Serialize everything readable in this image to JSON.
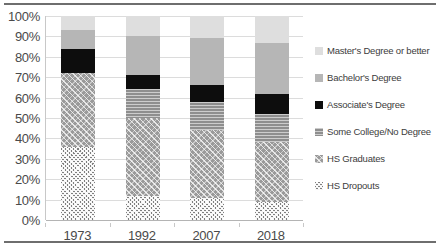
{
  "chart_data": {
    "type": "bar",
    "subtype": "stacked-bar-100-percent",
    "title": "",
    "xlabel": "",
    "ylabel": "",
    "categories": [
      "1973",
      "1992",
      "2007",
      "2018"
    ],
    "ylim": [
      0,
      100
    ],
    "y_ticks": [
      "0%",
      "10%",
      "20%",
      "30%",
      "40%",
      "50%",
      "60%",
      "70%",
      "80%",
      "90%",
      "100%"
    ],
    "y_tick_values": [
      0,
      10,
      20,
      30,
      40,
      50,
      60,
      70,
      80,
      90,
      100
    ],
    "grid": true,
    "legend_position": "right",
    "series": [
      {
        "name": "HS Dropouts",
        "swatch": "dots-sparse",
        "color": "#7f7f7f",
        "values": [
          36,
          12,
          11,
          9
        ]
      },
      {
        "name": "HS Graduates",
        "swatch": "crosshatch-dense",
        "color": "#9a9a9a",
        "values": [
          36,
          38,
          33,
          29
        ]
      },
      {
        "name": "Some College/No Degree",
        "swatch": "horizontal-lines",
        "color": "#8e8e8e",
        "values": [
          0,
          14,
          14,
          14
        ]
      },
      {
        "name": "Associate's Degree",
        "swatch": "solid-black",
        "color": "#0d0d0d",
        "values": [
          12,
          7,
          8,
          10
        ]
      },
      {
        "name": "Bachelor's Degree",
        "swatch": "solid-medium-gray",
        "color": "#b6b6b6",
        "values": [
          9,
          19,
          23,
          25
        ]
      },
      {
        "name": "Master's Degree or better",
        "swatch": "solid-light-gray",
        "color": "#dedede",
        "values": [
          7,
          10,
          11,
          13
        ]
      }
    ]
  },
  "legend": {
    "items": [
      {
        "label": "Master's Degree or better",
        "series": "Master's Degree or better"
      },
      {
        "label": "Bachelor's Degree",
        "series": "Bachelor's Degree"
      },
      {
        "label": "Associate's Degree",
        "series": "Associate's Degree"
      },
      {
        "label": "Some College/No Degree",
        "series": "Some College/No Degree"
      },
      {
        "label": "HS Graduates",
        "series": "HS Graduates"
      },
      {
        "label": "HS Dropouts",
        "series": "HS Dropouts"
      }
    ]
  },
  "colors": {
    "masters": "#dedede",
    "bachelors": "#b6b6b6",
    "associates": "#0d0d0d",
    "some_college": "#8e8e8e",
    "hs_graduates": "#9a9a9a",
    "hs_dropouts": "#7f7f7f",
    "gridline": "#dcdcdc",
    "axis": "#c8c8c8",
    "rule": "#6e6e6e",
    "text": "#4a4a4a"
  }
}
